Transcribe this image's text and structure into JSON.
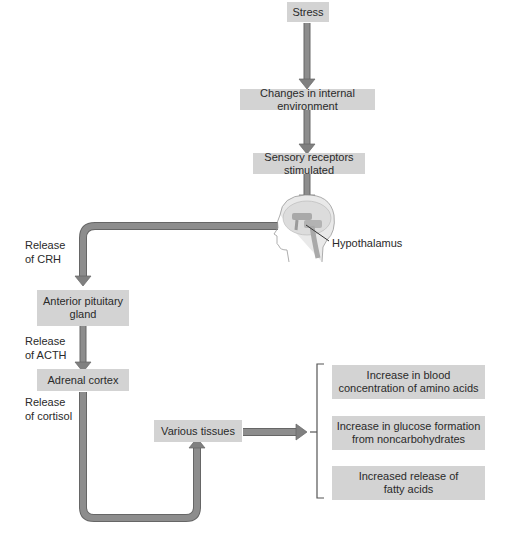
{
  "diagram": {
    "nodes": {
      "stress": "Stress",
      "internal": "Changes in internal environment",
      "receptors": "Sensory receptors stimulated",
      "hypothalamus": "Hypothalamus",
      "pituitary_1": "Anterior pituitary",
      "pituitary_2": "gland",
      "adrenal": "Adrenal cortex",
      "tissues": "Various tissues"
    },
    "edge_labels": {
      "crh_1": "Release",
      "crh_2": "of CRH",
      "acth_1": "Release",
      "acth_2": "of ACTH",
      "cortisol_1": "Release",
      "cortisol_2": "of cortisol"
    },
    "effects": [
      {
        "line1": "Increase in blood",
        "line2": "concentration of amino acids"
      },
      {
        "line1": "Increase in glucose formation",
        "line2": "from noncarbohydrates"
      },
      {
        "line1": "Increased release of",
        "line2": "fatty acids"
      }
    ],
    "colors": {
      "box": "#d3d3d3",
      "arrow": "#8a8a8a",
      "arrow_edge": "#666666"
    },
    "icons": {
      "head": "head-brain-icon"
    }
  }
}
